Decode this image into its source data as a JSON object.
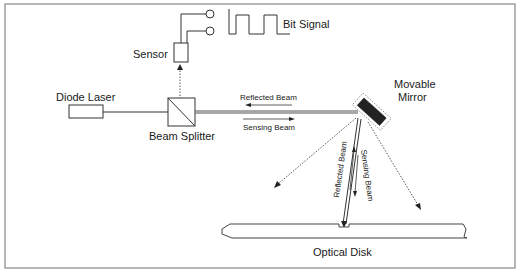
{
  "diagram": {
    "labels": {
      "bit_signal": "Bit Signal",
      "sensor": "Sensor",
      "diode_laser": "Diode Laser",
      "beam_splitter": "Beam  Splitter",
      "reflected_beam_h": "Reflected Beam",
      "sensing_beam_h": "Sensing Beam",
      "movable_mirror_1": "Movable",
      "movable_mirror_2": "Mirror",
      "reflected_beam_v": "Reflected Beam",
      "sensing_beam_v": "Sensing Beam",
      "optical_disk": "Optical  Disk"
    },
    "colors": {
      "line": "#333333",
      "frame": "#888888",
      "mirror": "#222222"
    }
  }
}
